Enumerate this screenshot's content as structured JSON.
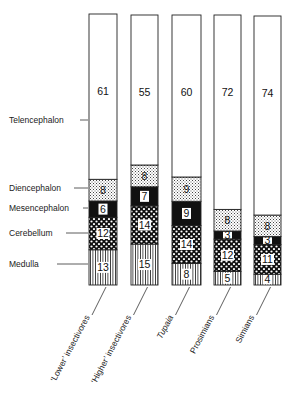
{
  "chart_data": {
    "type": "bar",
    "stacked": true,
    "orientation": "vertical",
    "title": "",
    "xlabel": "",
    "ylabel": "",
    "ylim": [
      0,
      100
    ],
    "unit": "percent of brain volume",
    "categories": [
      "'Lower' insectivores",
      "'Higher' insectivores",
      "Tupaia",
      "Prosimians",
      "Simians"
    ],
    "series": [
      {
        "name": "Medulla",
        "pattern": "vertical-lines",
        "values": [
          13,
          15,
          8,
          5,
          4
        ]
      },
      {
        "name": "Cerebellum",
        "pattern": "white-dots-on-black",
        "values": [
          12,
          14,
          14,
          12,
          11
        ]
      },
      {
        "name": "Mesencephalon",
        "pattern": "solid-black",
        "values": [
          6,
          7,
          9,
          3,
          3
        ]
      },
      {
        "name": "Diencephalon",
        "pattern": "fine-stipple",
        "values": [
          8,
          8,
          9,
          8,
          8
        ]
      },
      {
        "name": "Telencephalon",
        "pattern": "white",
        "values": [
          61,
          55,
          60,
          72,
          74
        ]
      }
    ],
    "legend": {
      "position": "left",
      "style": "leader-lines"
    },
    "grid": false
  },
  "labels": {
    "rows": [
      "Telencephalon",
      "Diencephalon",
      "Mesencephalon",
      "Cerebellum",
      "Medulla"
    ],
    "categories": [
      "‘Lower’ insectivores",
      "‘Higher’ insectivores",
      "Tupaia",
      "Prosimians",
      "Simians"
    ]
  }
}
